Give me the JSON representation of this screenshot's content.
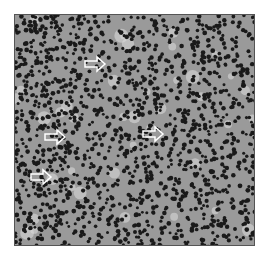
{
  "image": {
    "description": "Grayscale histology micrograph of densely packed small round dark lymphocyte nuclei with scattered pale cells; white outlined arrows point to cells of interest",
    "background_color": "#9a9a9a",
    "nucleus_color": "#1a1a1a",
    "arrows": [
      {
        "x": 84,
        "y": 57,
        "direction": "right"
      },
      {
        "x": 44,
        "y": 130,
        "direction": "right"
      },
      {
        "x": 142,
        "y": 127,
        "direction": "right"
      },
      {
        "x": 30,
        "y": 170,
        "direction": "right"
      }
    ]
  }
}
